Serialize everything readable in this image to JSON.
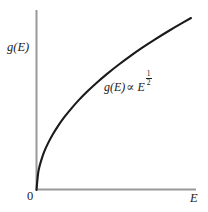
{
  "figure": {
    "background_color": "#ffffff",
    "axis_color": "#999999",
    "curve_color": "#1a1a1a",
    "origin_label": "0",
    "y_axis_label": "g(E)",
    "x_axis_label": "E",
    "annotation": {
      "function": "g(E)",
      "relation": "∝",
      "base": "E",
      "exponent_numerator": "1",
      "exponent_denominator": "2"
    }
  },
  "chart_data": {
    "type": "line",
    "title": "",
    "xlabel": "E",
    "ylabel": "g(E)",
    "grid": false,
    "legend": null,
    "annotations": [
      {
        "text": "g(E) ∝ E^(1/2)",
        "x": 0.44,
        "y": 0.66
      }
    ],
    "axis_origin_label": "0",
    "xlim": [
      0,
      1
    ],
    "ylim": [
      0,
      1
    ],
    "series": [
      {
        "name": "g(E) ∝ E^(1/2)",
        "formula": "y = x^0.5",
        "x": [
          0,
          0.01,
          0.02,
          0.04,
          0.06,
          0.09,
          0.12,
          0.16,
          0.2,
          0.25,
          0.3,
          0.36,
          0.42,
          0.49,
          0.56,
          0.64,
          0.72,
          0.81,
          0.9,
          1.0
        ],
        "y": [
          0,
          0.1,
          0.141,
          0.2,
          0.245,
          0.3,
          0.346,
          0.4,
          0.447,
          0.5,
          0.548,
          0.6,
          0.648,
          0.7,
          0.748,
          0.8,
          0.849,
          0.9,
          0.949,
          1.0
        ]
      }
    ]
  }
}
